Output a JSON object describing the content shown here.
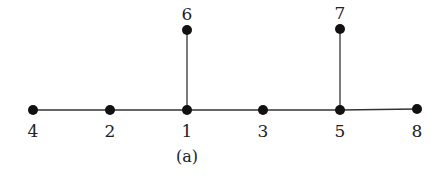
{
  "diagram": {
    "type": "tree-graph",
    "caption": "(a)",
    "nodes": [
      {
        "id": "4",
        "label": "4",
        "x": 33,
        "y": 110,
        "label_pos": "below"
      },
      {
        "id": "2",
        "label": "2",
        "x": 110,
        "y": 110,
        "label_pos": "below"
      },
      {
        "id": "1",
        "label": "1",
        "x": 187,
        "y": 110,
        "label_pos": "below"
      },
      {
        "id": "3",
        "label": "3",
        "x": 263,
        "y": 110,
        "label_pos": "below"
      },
      {
        "id": "5",
        "label": "5",
        "x": 340,
        "y": 110,
        "label_pos": "below"
      },
      {
        "id": "8",
        "label": "8",
        "x": 417,
        "y": 109,
        "label_pos": "below"
      },
      {
        "id": "6",
        "label": "6",
        "x": 187,
        "y": 30,
        "label_pos": "above"
      },
      {
        "id": "7",
        "label": "7",
        "x": 340,
        "y": 29,
        "label_pos": "above"
      }
    ],
    "edges": [
      [
        "4",
        "2"
      ],
      [
        "2",
        "1"
      ],
      [
        "1",
        "3"
      ],
      [
        "3",
        "5"
      ],
      [
        "5",
        "8"
      ],
      [
        "1",
        "6"
      ],
      [
        "5",
        "7"
      ]
    ],
    "colors": {
      "node": "#111111",
      "edge": "#333333",
      "text": "#222222"
    }
  }
}
